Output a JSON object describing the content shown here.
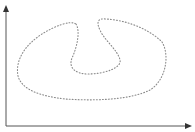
{
  "diagram": {
    "type": "dotted closed curve on 2D axes",
    "axes": {
      "origin": [
        6,
        126
      ],
      "y_axis_top": [
        6,
        6
      ],
      "x_axis_end": [
        191,
        126
      ],
      "color": "#555555",
      "labels": []
    },
    "curve": {
      "style": "dotted",
      "color": "#8a8a8a",
      "closed": true,
      "description": "kidney/heart-shaped loop with a notch at top center"
    }
  }
}
